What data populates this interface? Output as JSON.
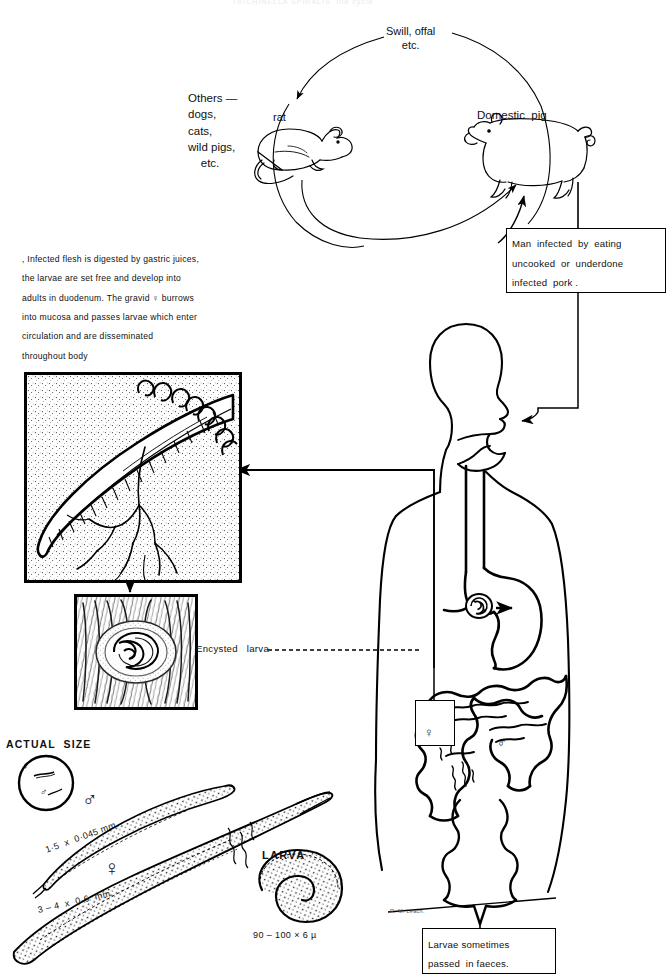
{
  "diagram": {
    "title_clipped": "TRICHINELLA SPIRALIS  life cycle",
    "signature": "R. M. Leach."
  },
  "cycle": {
    "swill_label": "Swill, offal\netc.",
    "rat_label": "rat",
    "pig_label": "Domestic  pig",
    "others_label": "Others —\ndogs,\ncats,\nwild pigs,\n    etc."
  },
  "boxes": {
    "man_infected": "Man  infected  by  eating\nuncooked  or  underdone\ninfected  pork .",
    "faeces": "Larvae sometimes\npassed  in faeces."
  },
  "paragraph": {
    "text": ", Infected flesh is digested by gastric juices,\nthe larvae are set free and develop into\nadults in duodenum. The gravid ♀ burrows\ninto mucosa and passes larvae which enter\ncirculation and are disseminated\nthroughout body"
  },
  "panels": {
    "muscle_panel_name": "adult worm in intestinal mucosa",
    "cyst_panel_name": "encysted larva in muscle",
    "encysted_label": "Encysted   larva"
  },
  "actual_size": {
    "heading": "ACTUAL  SIZE",
    "female_symbol": "♀",
    "male_symbol": "♂",
    "male_measure": "1·5  x  0·045 mm.",
    "female_measure": "3 – 4  x  0·6  mm.",
    "larva_heading": "LARVA",
    "larva_measure": "90 – 100 × 6 µ"
  },
  "body_markers": {
    "female_symbol": "♀",
    "male_symbol": "♂"
  },
  "colors": {
    "ink": "#000000",
    "paper": "#ffffff"
  }
}
